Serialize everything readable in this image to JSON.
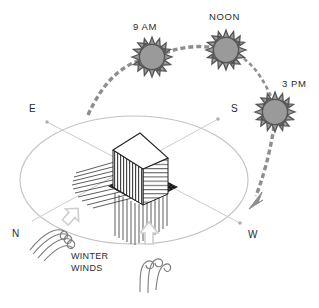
{
  "diagram": {
    "background": "#ffffff",
    "sun": {
      "fill": "#9a9a9a",
      "stroke": "#555555",
      "path_color": "#8e8e8e",
      "positions": [
        {
          "id": "sun-9am",
          "label": "9 AM",
          "cx": 152,
          "cy": 57,
          "r": 13,
          "label_x": 133,
          "label_y": 27
        },
        {
          "id": "sun-noon",
          "label": "NOON",
          "cx": 226,
          "cy": 50,
          "r": 13,
          "label_x": 211,
          "label_y": 17
        },
        {
          "id": "sun-3pm",
          "label": "3 PM",
          "cx": 275,
          "cy": 112,
          "r": 13,
          "label_x": 283,
          "label_y": 84
        }
      ]
    },
    "compass": {
      "color": "#9e9e9e",
      "points": [
        {
          "id": "compass-e",
          "label": "E",
          "label_x": 31,
          "label_y": 108,
          "node_x": 47,
          "node_y": 122
        },
        {
          "id": "compass-s",
          "label": "S",
          "label_x": 232,
          "label_y": 108,
          "node_x": 218,
          "node_y": 119
        },
        {
          "id": "compass-w",
          "label": "W",
          "label_x": 249,
          "label_y": 234,
          "node_x": 240,
          "node_y": 223
        },
        {
          "id": "compass-n",
          "label": "N",
          "label_x": 13,
          "label_y": 232,
          "node_x": 32,
          "node_y": 220
        }
      ]
    },
    "building": {
      "id": "building-block",
      "top_fill": "#ffffff",
      "left_face_fill": "#d9d9d9",
      "right_face_fill": "#ffffff",
      "shadow_fill": "#111111",
      "outline": "#222222"
    },
    "winds": {
      "label": "WINTER\nWINDS",
      "label_line1": "WINTER",
      "label_line2": "WINDS",
      "label_x": 73,
      "label_y": 253,
      "arrow_color": "#cfcfcf",
      "swirl_color": "#777777",
      "glyphs": [
        {
          "id": "wind-swirl-north",
          "x": 42,
          "y": 228
        },
        {
          "id": "wind-swirl-south",
          "x": 148,
          "y": 262
        }
      ],
      "arrows": [
        {
          "id": "wind-arrow-north",
          "x": 72,
          "y": 215,
          "rotation": -42
        },
        {
          "id": "wind-arrow-south",
          "x": 149,
          "y": 232,
          "rotation": 0
        }
      ]
    },
    "annotations": {
      "sun_path_description": "dashed arc from east horizon through 9 AM, NOON, 3 PM to west horizon",
      "arrowhead_color": "#8e8e8e"
    }
  }
}
